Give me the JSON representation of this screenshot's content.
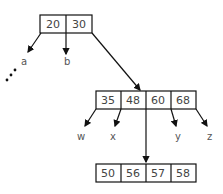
{
  "diagram": {
    "type": "b-tree",
    "root": {
      "keys": [
        "20",
        "30"
      ]
    },
    "root_children": [
      "a",
      "b"
    ],
    "root_ellipsis": "...",
    "middle": {
      "keys": [
        "35",
        "48",
        "60",
        "68"
      ]
    },
    "middle_children": [
      "w",
      "x",
      "y",
      "z"
    ],
    "leaf": {
      "keys": [
        "50",
        "56",
        "57",
        "58"
      ]
    }
  }
}
